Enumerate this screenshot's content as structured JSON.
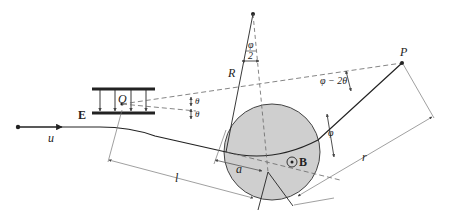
{
  "diagram": {
    "title": "",
    "labels": {
      "velocity": "u",
      "field_E": "E",
      "origin": "O",
      "theta_upper": "θ",
      "theta_lower": "θ",
      "phi_half_num": "φ",
      "phi_half_den": "2",
      "radius_R": "R",
      "angle_phi_minus_2theta": "φ − 2θ",
      "point_P": "P",
      "angle_phi": "φ",
      "field_B": "B",
      "distance_r": "r",
      "distance_l": "l",
      "radius_a": "a"
    },
    "colors": {
      "line": "#222222",
      "dashed": "#555555",
      "circle_fill": "#cfcfcf",
      "circle_stroke": "#444444",
      "dimension": "#666666"
    }
  }
}
